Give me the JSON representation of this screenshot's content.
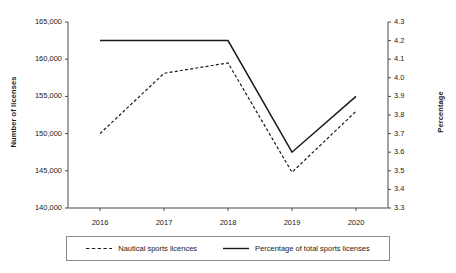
{
  "chart_data": {
    "type": "line",
    "title": "",
    "xlabel": "",
    "categories": [
      "2016",
      "2017",
      "2018",
      "2019",
      "2020"
    ],
    "grid": false,
    "legend_position": "bottom",
    "axes": {
      "left": {
        "label": "Number of licenses",
        "ylim": [
          140000,
          165000
        ],
        "step": 5000,
        "ticks": [
          "140,000",
          "145,000",
          "150,000",
          "155,000",
          "160,000",
          "165,000"
        ],
        "tick_values": [
          140000,
          145000,
          150000,
          155000,
          160000,
          165000
        ]
      },
      "right": {
        "label": "Percentage",
        "ylim": [
          3.3,
          4.3
        ],
        "step": 0.1,
        "ticks": [
          "3.3",
          "3.4",
          "3.5",
          "3.6",
          "3.7",
          "3.8",
          "3.9",
          "4.0",
          "4.1",
          "4.2",
          "4.3"
        ],
        "tick_values": [
          3.3,
          3.4,
          3.5,
          3.6,
          3.7,
          3.8,
          3.9,
          4.0,
          4.1,
          4.2,
          4.3
        ]
      }
    },
    "series": [
      {
        "name": "Nautical sports licences",
        "axis": "left",
        "style": "dashed",
        "color": "#1a1a1a",
        "values": [
          150000,
          158100,
          159500,
          144800,
          153000
        ]
      },
      {
        "name": "Percentage of total sports licenses",
        "axis": "right",
        "style": "solid",
        "color": "#1a1a1a",
        "values": [
          4.2,
          4.2,
          4.2,
          3.6,
          3.9
        ]
      }
    ]
  },
  "legend": {
    "items": [
      {
        "label": "Nautical sports licences",
        "style": "dashed"
      },
      {
        "label": "Percentage of total sports licenses",
        "style": "solid"
      }
    ]
  }
}
